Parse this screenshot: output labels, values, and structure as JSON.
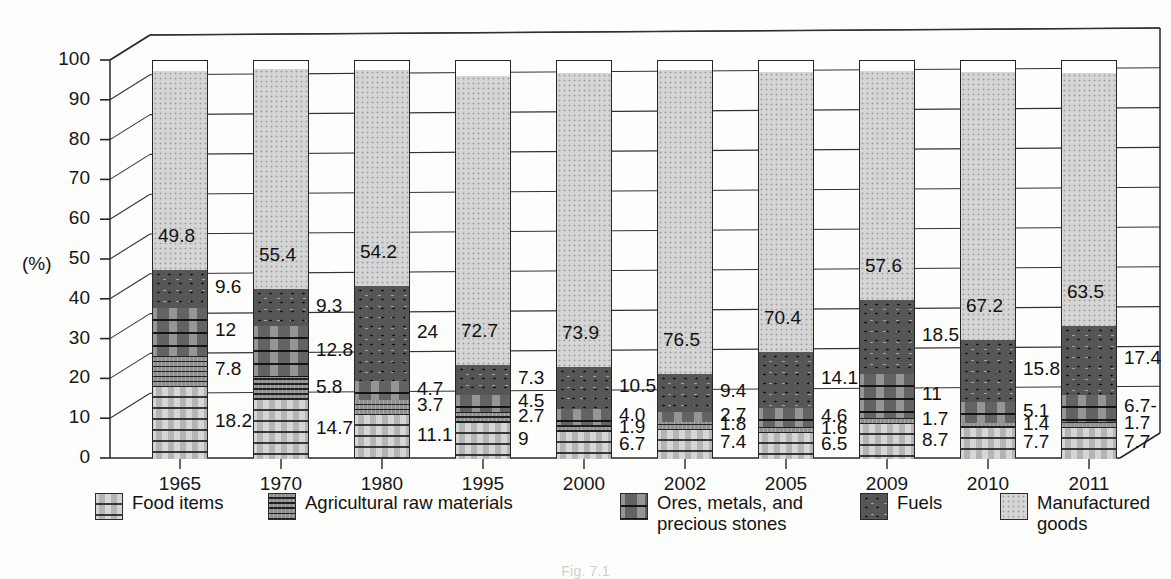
{
  "axis": {
    "y_unit": "(%)",
    "y_ticks": [
      "100",
      "90",
      "80",
      "70",
      "60",
      "50",
      "40",
      "30",
      "20",
      "10",
      "0"
    ],
    "y_min": 0,
    "y_max": 100
  },
  "legend": {
    "items": [
      {
        "label": "Food items",
        "key": "food",
        "swatch": "food-swatch"
      },
      {
        "label": "Agricultural raw materials",
        "key": "agri",
        "swatch": "agri-swatch"
      },
      {
        "label": "Ores, metals, and precious stones",
        "key": "ores",
        "swatch": "ores-swatch"
      },
      {
        "label": "Fuels",
        "key": "fuel",
        "swatch": "fuels-swatch"
      },
      {
        "label": "Manufactured goods",
        "key": "manu",
        "swatch": "manufactured-swatch"
      }
    ]
  },
  "caption": "Fig. 7.1",
  "chart_data": {
    "type": "bar",
    "stacked": true,
    "title": "",
    "xlabel": "",
    "ylabel": "(%)",
    "ylim": [
      0,
      100
    ],
    "grid": true,
    "legend_position": "bottom",
    "categories": [
      "1965",
      "1970",
      "1980",
      "1995",
      "2000",
      "2002",
      "2005",
      "2009",
      "2010",
      "2011"
    ],
    "series": [
      {
        "name": "Food items",
        "values": [
          18.2,
          14.7,
          11.1,
          9.0,
          6.7,
          7.4,
          6.5,
          8.7,
          7.7,
          7.7
        ],
        "labels": [
          "18.2",
          "14.7",
          "11.1",
          "9",
          "6.7",
          "7.4",
          "6.5",
          "8.7",
          "7.7",
          "7.7"
        ]
      },
      {
        "name": "Agricultural raw materials",
        "values": [
          7.8,
          5.8,
          3.7,
          2.7,
          1.9,
          1.8,
          1.6,
          1.7,
          1.4,
          1.7
        ],
        "labels": [
          "7.8",
          "5.8",
          "3.7",
          "2.7",
          "1.9",
          "1.8",
          "1.6",
          "1.7",
          "1.4",
          "1.7"
        ]
      },
      {
        "name": "Ores, metals, and precious stones",
        "values": [
          12.0,
          12.8,
          4.7,
          4.5,
          4.0,
          2.7,
          4.6,
          11.0,
          5.1,
          6.7
        ],
        "labels": [
          "12",
          "12.8",
          "4.7",
          "4.5",
          "4.0",
          "2.7",
          "4.6",
          "11",
          "5.1",
          "6.7-"
        ]
      },
      {
        "name": "Fuels",
        "values": [
          9.6,
          9.3,
          24.0,
          7.3,
          10.5,
          9.4,
          14.1,
          18.5,
          15.8,
          17.4
        ],
        "labels": [
          "9.6",
          "9.3",
          "24",
          "7.3",
          "10.5",
          "9.4",
          "14.1",
          "18.5",
          "15.8",
          "17.4"
        ]
      },
      {
        "name": "Manufactured goods",
        "values": [
          49.8,
          55.4,
          54.2,
          72.7,
          73.9,
          76.5,
          70.4,
          57.6,
          67.2,
          63.5
        ],
        "labels": [
          "49.8",
          "55.4",
          "54.2",
          "72.7",
          "73.9",
          "76.5",
          "70.4",
          "57.6",
          "67.2",
          "63.5"
        ]
      }
    ]
  }
}
